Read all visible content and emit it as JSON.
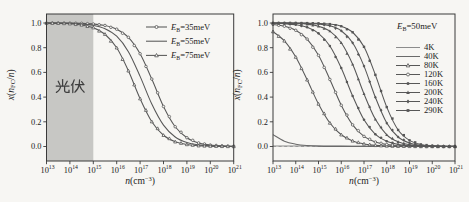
{
  "figure": {
    "width": 469,
    "height": 202,
    "background": "#f7f6f3",
    "frame_color": "#3a3a3a",
    "text_color": "#222222"
  },
  "chart_data": [
    {
      "id": "chart-binding-energy",
      "type": "line",
      "xlabel_segments": [
        {
          "t": "n",
          "i": true
        },
        {
          "t": "(cm"
        },
        {
          "t": "−3",
          "sup": true
        },
        {
          "t": ")"
        }
      ],
      "ylabel_segments": [
        {
          "t": "x",
          "i": true
        },
        {
          "t": "("
        },
        {
          "t": "n",
          "i": true
        },
        {
          "t": "FC",
          "sub": true
        },
        {
          "t": "/"
        },
        {
          "t": "n",
          "i": true
        },
        {
          "t": ")"
        }
      ],
      "xlim_exp": [
        13,
        21
      ],
      "ylim": [
        0,
        1
      ],
      "x_log_ticks": [
        13,
        14,
        15,
        16,
        17,
        18,
        19,
        20,
        21
      ],
      "y_ticks": [
        0.0,
        0.2,
        0.4,
        0.6,
        0.8,
        1.0
      ],
      "frame": {
        "left": 46.5,
        "top": 14,
        "right": 233.7,
        "bottom": 161,
        "y_of_0": 146.5,
        "y_of_1": 23
      },
      "shade": {
        "exp_from": 13,
        "exp_to": 15,
        "color": "#c7c7c4",
        "label": "光伏",
        "label_x": 69,
        "label_y": 90,
        "label_color": "#3f3f3f",
        "label_paths": [
          "M62.6,79.5 L62.6,85.8",
          "M58.2,81.2 L59.8,84.6",
          "M67.2,81.2 L65.4,84.6",
          "M56.2,86 L69,86",
          "M60.6,86.2 Q60.2,90 56.4,92.4",
          "M64.6,86.2 L64.6,90.6 Q64.6,92.4 66.6,92.4 L69,92.4 L69,90.2",
          "M74.2,79.8 Q73.4,83 71.4,85.2",
          "M72.8,83.6 L72.8,92.6",
          "M75.4,84.6 L84,84.6",
          "M79.6,79.8 L79.2,84.4 Q78.4,89.4 74.8,92.2",
          "M79.4,85 Q80.8,89.4 84.2,92.2",
          "M81.6,81.6 L83.2,83.6"
        ]
      },
      "zero_line": false,
      "legend": {
        "x": 146,
        "y": 27,
        "row_h": 14.2,
        "line_len": 21,
        "text_gap": 4,
        "items": [
          {
            "segments": [
              {
                "t": "E",
                "i": true
              },
              {
                "t": "B",
                "sub": true
              },
              {
                "t": "=35meV"
              }
            ],
            "marker": "circle-open",
            "color": "#575757"
          },
          {
            "segments": [
              {
                "t": "E",
                "i": true
              },
              {
                "t": "B",
                "sub": true
              },
              {
                "t": "=55meV"
              }
            ],
            "marker": "none",
            "color": "#575757"
          },
          {
            "segments": [
              {
                "t": "E",
                "i": true
              },
              {
                "t": "B",
                "sub": true
              },
              {
                "t": "=75meV"
              }
            ],
            "marker": "triangle-open",
            "color": "#575757"
          }
        ]
      },
      "series": [
        {
          "name": "EB=35meV",
          "marker": "circle-open",
          "color": "#575757",
          "x_start": 13,
          "x_step": 0.5,
          "values": [
            1,
            0.999,
            0.999,
            0.997,
            0.992,
            0.98,
            0.95,
            0.884,
            0.751,
            0.546,
            0.324,
            0.16,
            0.071,
            0.029,
            0.012,
            0.005,
            0.002
          ]
        },
        {
          "name": "EB=55meV",
          "marker": "none",
          "color": "#575757",
          "x_start": 13,
          "x_step": 0.5,
          "values": [
            0.999,
            0.999,
            0.997,
            0.992,
            0.981,
            0.954,
            0.893,
            0.768,
            0.568,
            0.344,
            0.173,
            0.077,
            0.032,
            0.013,
            0.005,
            0.002,
            0.001
          ]
        },
        {
          "name": "EB=75meV",
          "marker": "triangle-open",
          "color": "#575757",
          "x_start": 13,
          "x_step": 0.5,
          "values": [
            0.999,
            0.998,
            0.994,
            0.984,
            0.962,
            0.909,
            0.799,
            0.613,
            0.387,
            0.201,
            0.091,
            0.038,
            0.016,
            0.006,
            0.003,
            0.001,
            0
          ]
        }
      ]
    },
    {
      "id": "chart-temperature",
      "type": "line",
      "xlabel_segments": [
        {
          "t": "n",
          "i": true
        },
        {
          "t": "(cm"
        },
        {
          "t": "−3",
          "sup": true
        },
        {
          "t": ")"
        }
      ],
      "ylabel_segments": [
        {
          "t": "x",
          "i": true
        },
        {
          "t": "("
        },
        {
          "t": "n",
          "i": true
        },
        {
          "t": "FC",
          "sub": true
        },
        {
          "t": "/"
        },
        {
          "t": "n",
          "i": true
        },
        {
          "t": ")"
        }
      ],
      "xlim_exp": [
        13,
        21
      ],
      "ylim": [
        0,
        1
      ],
      "x_log_ticks": [
        13,
        14,
        15,
        16,
        17,
        18,
        19,
        20,
        21
      ],
      "y_ticks": [
        0.0,
        0.2,
        0.4,
        0.6,
        0.8,
        1.0
      ],
      "frame": {
        "left": 273,
        "top": 14,
        "right": 455,
        "bottom": 161,
        "y_of_0": 146.5,
        "y_of_1": 23
      },
      "shade": null,
      "zero_line": true,
      "legend": {
        "x": 396,
        "y": 47.5,
        "row_h": 9,
        "line_len": 24,
        "text_gap": 4,
        "title_segments": [
          {
            "t": "E",
            "i": true
          },
          {
            "t": "B",
            "sub": true
          },
          {
            "t": "=50meV"
          }
        ],
        "title_x": 397,
        "title_y": 29,
        "items": [
          {
            "segments": [
              {
                "t": "4K"
              }
            ],
            "marker": "none",
            "color": "#8c8c8c"
          },
          {
            "segments": [
              {
                "t": "40K"
              }
            ],
            "marker": "none",
            "color": "#6a6a6a"
          },
          {
            "segments": [
              {
                "t": "80K"
              }
            ],
            "marker": "triangle-open",
            "color": "#575757"
          },
          {
            "segments": [
              {
                "t": "120K"
              }
            ],
            "marker": "circle-open",
            "color": "#575757"
          },
          {
            "segments": [
              {
                "t": "160K"
              }
            ],
            "marker": "circle-filled",
            "color": "#575757"
          },
          {
            "segments": [
              {
                "t": "200K"
              }
            ],
            "marker": "triangle-filled",
            "color": "#575757"
          },
          {
            "segments": [
              {
                "t": "240K"
              }
            ],
            "marker": "diamond-filled",
            "color": "#575757"
          },
          {
            "segments": [
              {
                "t": "290K"
              }
            ],
            "marker": "square-filled",
            "color": "#575757"
          }
        ]
      },
      "series": [
        {
          "name": "4K",
          "marker": "none",
          "color": "#8c8c8c",
          "x_start": 13,
          "x_step": 0.5,
          "values": [
            0.004,
            0.004,
            0.004,
            0.004,
            0.004,
            0.004,
            0.004,
            0.004,
            0.004,
            0.004,
            0.004,
            0.004,
            0.004,
            0.004,
            0.004,
            0.004,
            0.004
          ]
        },
        {
          "name": "40K",
          "marker": "none",
          "color": "#6a6a6a",
          "x_start": 13,
          "x_step": 0.5,
          "values": [
            0.096,
            0.043,
            0.019,
            0.008,
            0.003,
            0.001,
            0.001,
            0,
            0,
            0,
            0,
            0,
            0,
            0,
            0,
            0,
            0
          ]
        },
        {
          "name": "80K",
          "marker": "triangle-open",
          "color": "#575757",
          "x_start": 13,
          "x_step": 0.5,
          "values": [
            0.93,
            0.855,
            0.724,
            0.54,
            0.344,
            0.19,
            0.095,
            0.045,
            0.021,
            0.009,
            0.004,
            0.002,
            0.001,
            0,
            0,
            0,
            0
          ]
        },
        {
          "name": "120K",
          "marker": "circle-open",
          "color": "#575757",
          "x_start": 13,
          "x_step": 0.5,
          "values": [
            0.989,
            0.974,
            0.941,
            0.87,
            0.738,
            0.543,
            0.334,
            0.175,
            0.082,
            0.036,
            0.016,
            0.007,
            0.003,
            0.001,
            0.001,
            0,
            0
          ]
        },
        {
          "name": "160K",
          "marker": "circle-filled",
          "color": "#575757",
          "x_start": 13,
          "x_step": 0.5,
          "values": [
            0.998,
            0.994,
            0.986,
            0.965,
            0.916,
            0.814,
            0.635,
            0.409,
            0.216,
            0.099,
            0.042,
            0.017,
            0.007,
            0.003,
            0.001,
            0,
            0
          ]
        },
        {
          "name": "200K",
          "marker": "triangle-filled",
          "color": "#575757",
          "x_start": 13,
          "x_step": 0.5,
          "values": [
            0.999,
            0.999,
            0.996,
            0.99,
            0.974,
            0.934,
            0.84,
            0.666,
            0.426,
            0.22,
            0.095,
            0.038,
            0.015,
            0.006,
            0.002,
            0.001,
            0
          ]
        },
        {
          "name": "240K",
          "marker": "diamond-filled",
          "color": "#575757",
          "x_start": 13,
          "x_step": 0.5,
          "values": [
            1,
            1,
            0.999,
            0.997,
            0.992,
            0.977,
            0.937,
            0.84,
            0.651,
            0.398,
            0.19,
            0.077,
            0.029,
            0.01,
            0.004,
            0.001,
            0.001
          ]
        },
        {
          "name": "290K",
          "marker": "square-filled",
          "color": "#575757",
          "x_start": 13,
          "x_step": 0.5,
          "values": [
            1,
            1,
            1,
            0.999,
            0.997,
            0.991,
            0.974,
            0.925,
            0.807,
            0.58,
            0.319,
            0.134,
            0.05,
            0.017,
            0.006,
            0.002,
            0.001
          ]
        }
      ]
    }
  ]
}
